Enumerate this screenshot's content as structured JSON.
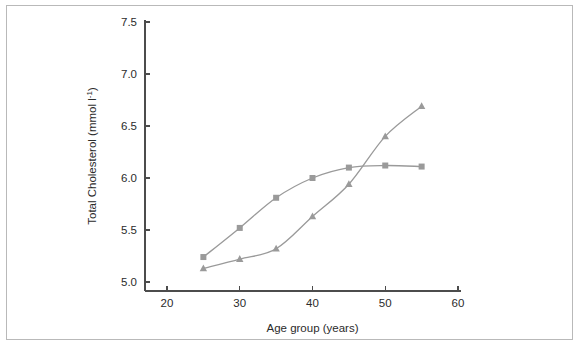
{
  "figure": {
    "border_color": "#b9b9b9",
    "background": "#ffffff"
  },
  "chart_data": {
    "type": "line",
    "title": "",
    "subtitle": "",
    "xlabel": "Age group (years)",
    "ylabel": "Total Cholesterol (mmol l",
    "ylabel_superscript": "-1",
    "ylabel_suffix": ")",
    "x": [
      25,
      30,
      35,
      40,
      45,
      50,
      55
    ],
    "xlim": [
      17,
      62
    ],
    "ylim": [
      4.78,
      7.62
    ],
    "xticks": [
      20,
      30,
      40,
      50,
      60
    ],
    "xtick_labels": [
      "20",
      "30",
      "40",
      "50",
      "60"
    ],
    "yticks": [
      5.0,
      5.5,
      6.0,
      6.5,
      7.0,
      7.5
    ],
    "ytick_labels": [
      "5.0",
      "5.5",
      "6.0",
      "6.5",
      "7.0",
      "7.5"
    ],
    "grid": false,
    "legend": "none",
    "series": [
      {
        "name": "series-squares",
        "marker": "square",
        "color": "#9a9a9a",
        "values": [
          5.24,
          5.52,
          5.81,
          6.0,
          6.1,
          6.12,
          6.11
        ]
      },
      {
        "name": "series-triangles",
        "marker": "triangle",
        "color": "#9a9a9a",
        "values": [
          5.13,
          5.22,
          5.32,
          5.63,
          5.94,
          6.4,
          6.69
        ]
      }
    ]
  }
}
